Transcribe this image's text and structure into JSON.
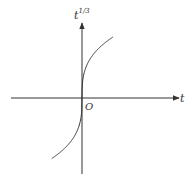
{
  "chart_data": {
    "type": "line",
    "title": "",
    "xlabel": "t",
    "ylabel": "t^(1/3)",
    "ylabel_base": "t",
    "ylabel_exponent": "1/3",
    "origin_label": "O",
    "function": "y = t^(1/3)",
    "grid": false,
    "legend": null,
    "axis_style": "arrows, no ticks",
    "series": [
      {
        "name": "t^(1/3)",
        "x": [
          -8,
          -4,
          -2,
          -1,
          -0.5,
          -0.1,
          0,
          0.1,
          0.5,
          1,
          2,
          4,
          8
        ],
        "y": [
          -2,
          -1.587,
          -1.26,
          -1,
          -0.794,
          -0.464,
          0,
          0.464,
          0.794,
          1,
          1.26,
          1.587,
          2
        ]
      }
    ]
  },
  "colors": {
    "line": "#333333",
    "background": "#ffffff"
  },
  "labels": {
    "y_base": "t",
    "y_exp": "1/3",
    "x": "t",
    "origin": "O"
  }
}
